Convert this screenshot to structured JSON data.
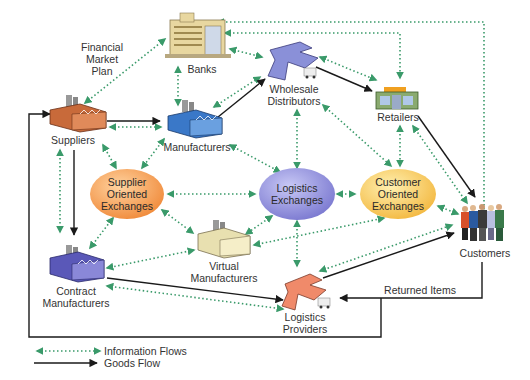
{
  "diagram": {
    "title_annotation": "Financial Market Plan",
    "colors": {
      "info_flow": "#3a9a6a",
      "goods_flow": "#1a1a1a",
      "supplier_exchange": "#f0a050",
      "logistics_exchange": "#8a88d8",
      "customer_exchange": "#f5c860"
    },
    "nodes": {
      "banks": {
        "label": "Banks",
        "icon": "bank-building-icon"
      },
      "suppliers": {
        "label": "Suppliers",
        "icon": "factory-orange-icon"
      },
      "manufacturers": {
        "label": "Manufacturers",
        "icon": "factory-blue-icon"
      },
      "wholesale": {
        "line1": "Wholesale",
        "line2": "Distributors",
        "icon": "warehouse-blue-icon"
      },
      "retailers": {
        "label": "Retailers",
        "icon": "store-icon"
      },
      "customers": {
        "label": "Customers",
        "icon": "people-group-icon"
      },
      "contract": {
        "line1": "Contract",
        "line2": "Manufacturers",
        "icon": "factory-purple-icon"
      },
      "virtual": {
        "line1": "Virtual",
        "line2": "Manufacturers",
        "icon": "factory-cream-icon"
      },
      "logistics_providers": {
        "line1": "Logistics",
        "line2": "Providers",
        "icon": "warehouse-orange-icon"
      }
    },
    "exchanges": {
      "supplier": {
        "line1": "Supplier",
        "line2": "Oriented",
        "line3": "Exchanges"
      },
      "logistics": {
        "line1": "Logistics",
        "line2": "Exchanges"
      },
      "customer": {
        "line1": "Customer",
        "line2": "Oriented",
        "line3": "Exchanges"
      }
    },
    "annotations": {
      "financial_1": "Financial",
      "financial_2": "Market",
      "financial_3": "Plan",
      "returned_items": "Returned Items"
    },
    "legend": {
      "info": "Information Flows",
      "goods": "Goods Flow"
    }
  }
}
